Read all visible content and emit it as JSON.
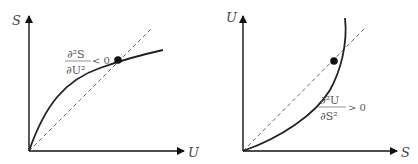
{
  "panels": [
    {
      "id": "entropy-concave",
      "y_axis_label": "S",
      "x_axis_label": "U",
      "annotation": {
        "numerator": "∂²S",
        "denominator": "∂U²",
        "relation": "< 0"
      },
      "curve": "concave",
      "marker": "tangent point"
    },
    {
      "id": "energy-convex",
      "y_axis_label": "U",
      "x_axis_label": "S",
      "annotation": {
        "numerator": "∂²U",
        "denominator": "∂S²",
        "relation": "> 0"
      },
      "curve": "convex",
      "marker": "intersection point"
    }
  ],
  "colors": {
    "axis": "#111111",
    "curve": "#222222",
    "dashed": "#555555",
    "text": "#444444"
  }
}
